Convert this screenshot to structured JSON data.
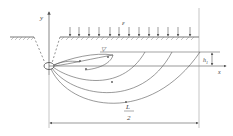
{
  "diagram": {
    "type": "tunnel-seepage-cross-section",
    "labels": {
      "y_axis": "y",
      "x_axis": "x",
      "surface_load": "ε",
      "depth": "h",
      "depth_subscript": "1",
      "half_span_numerator": "L",
      "half_span_denominator": "2",
      "water_table": "▽"
    },
    "colors": {
      "line": "#555555",
      "dashed": "#666666",
      "text": "#444444",
      "background": "#ffffff"
    }
  }
}
